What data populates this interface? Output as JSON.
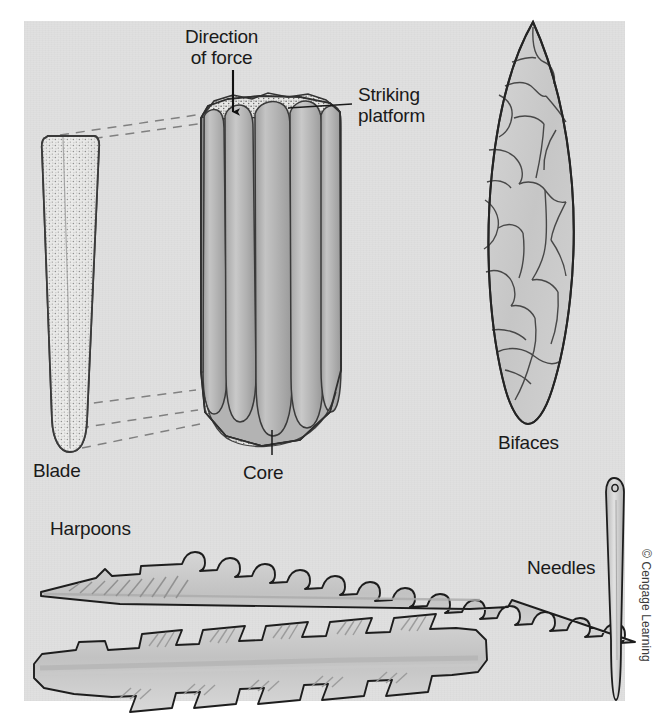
{
  "figure": {
    "panel_background_color": "#e0e0e0",
    "page_background_color": "#ffffff",
    "ink_color": "#1a1a1a"
  },
  "labels": {
    "direction_of_force": "Direction\nof force",
    "striking_platform": "Striking\nplatform",
    "blade": "Blade",
    "core": "Core",
    "bifaces": "Bifaces",
    "harpoons": "Harpoons",
    "needles": "Needles"
  },
  "credit": {
    "text": "© Cengage Learning"
  },
  "artifacts": {
    "blade": {
      "name": "Blade",
      "description": "Long narrow flake with stippled dorsal surface, rounded distal tip",
      "fill": "#e8e8e6",
      "stroke": "#2b2b2b"
    },
    "core": {
      "name": "Core",
      "description": "Prismatic blade core with five vertical flake-scar channels and stippled striking platform",
      "flake_scar_count": 5,
      "fill": "#b9b9b9",
      "platform_fill": "#e6e6e4",
      "stroke": "#2b2b2b"
    },
    "biface": {
      "name": "Bifaces",
      "description": "Leaf-shaped laurel-leaf point with irregular polygonal flake scars",
      "flake_scar_count": 22,
      "fill": "#cfcfcf",
      "stroke": "#2b2b2b"
    },
    "harpoon_unilateral": {
      "name": "Harpoon (unilaterally barbed)",
      "barb_count": 14,
      "fill": "#cccccc",
      "stroke": "#1d1d1d"
    },
    "harpoon_bilateral": {
      "name": "Harpoon (bilaterally barbed)",
      "barb_count_top": 5,
      "barb_count_bottom": 5,
      "fill": "#cdcdcd",
      "stroke": "#1d1d1d"
    },
    "needle": {
      "name": "Needles",
      "description": "Slender bone needle with eye at proximal end",
      "fill": "#dcdcdc",
      "stroke": "#1d1d1d"
    }
  },
  "annotations": {
    "force_arrow": {
      "description": "Vertical arrow pointing down onto the core striking platform"
    },
    "leader_striking_platform": {
      "description": "Horizontal leader line from the Striking platform label to the core top"
    },
    "leader_core": {
      "description": "Vertical leader line from the Core label to the core base"
    },
    "blade_correspondence_lines": {
      "description": "Dashed lines linking the detached blade to its scar on the core",
      "count": 4,
      "style": "dashed"
    }
  }
}
